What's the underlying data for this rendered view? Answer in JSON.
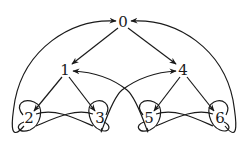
{
  "diagram": {
    "type": "directed-graph",
    "stroke_color": "#1a1a1a",
    "background": "#ffffff",
    "nodes": [
      {
        "id": "0",
        "label": "0",
        "x": 123,
        "y": 22
      },
      {
        "id": "1",
        "label": "1",
        "x": 65,
        "y": 70
      },
      {
        "id": "4",
        "label": "4",
        "x": 183,
        "y": 70
      },
      {
        "id": "2",
        "label": "2",
        "x": 29,
        "y": 118
      },
      {
        "id": "3",
        "label": "3",
        "x": 100,
        "y": 118
      },
      {
        "id": "5",
        "label": "5",
        "x": 149,
        "y": 118
      },
      {
        "id": "6",
        "label": "6",
        "x": 220,
        "y": 118
      }
    ],
    "edges": [
      {
        "from": "0",
        "to": "1"
      },
      {
        "from": "0",
        "to": "4"
      },
      {
        "from": "1",
        "to": "2"
      },
      {
        "from": "1",
        "to": "3"
      },
      {
        "from": "4",
        "to": "5"
      },
      {
        "from": "4",
        "to": "6"
      },
      {
        "from": "2",
        "to": "3"
      },
      {
        "from": "3",
        "to": "2"
      },
      {
        "from": "5",
        "to": "6"
      },
      {
        "from": "6",
        "to": "5"
      },
      {
        "from": "2",
        "to": "0"
      },
      {
        "from": "6",
        "to": "0"
      },
      {
        "from": "3",
        "to": "4"
      },
      {
        "from": "5",
        "to": "1"
      },
      {
        "from": "2",
        "to": "2",
        "self_loop": true
      },
      {
        "from": "3",
        "to": "3",
        "self_loop": true
      },
      {
        "from": "5",
        "to": "5",
        "self_loop": true
      },
      {
        "from": "6",
        "to": "6",
        "self_loop": true
      }
    ]
  }
}
